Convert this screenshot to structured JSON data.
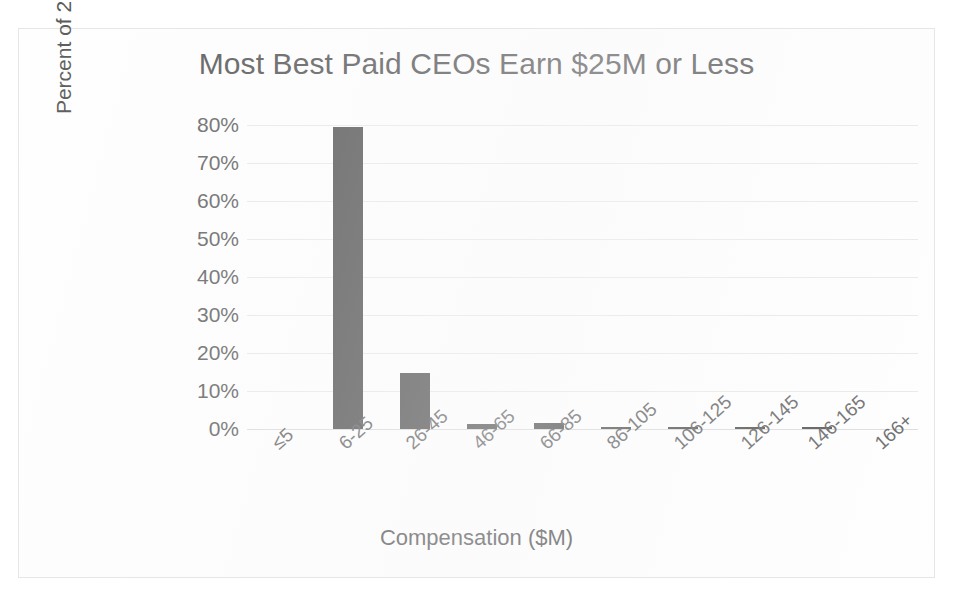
{
  "chart_data": {
    "type": "bar",
    "title": "Most Best Paid CEOs Earn $25M or Less",
    "xlabel": "Compensation ($M)",
    "ylabel": "Percent of 200 Best Paid CEOs",
    "categories": [
      "≤5",
      "6-25",
      "26-45",
      "46-65",
      "66-85",
      "86-105",
      "106-125",
      "126-145",
      "146-165",
      "166+"
    ],
    "values": [
      0,
      79.5,
      14.8,
      1.3,
      1.5,
      0.5,
      0.5,
      0.5,
      0.5,
      0
    ],
    "value_labels": [
      "0%",
      "79.5%",
      "14.8%",
      "1.3%",
      "1.5%",
      "0.5%",
      "0.5%",
      "0.5%",
      "0.5%",
      "0%"
    ],
    "ylim": [
      0,
      80
    ],
    "ytick_values": [
      0,
      10,
      20,
      30,
      40,
      50,
      60,
      70,
      80
    ],
    "ytick_labels": [
      "0%",
      "10%",
      "20%",
      "30%",
      "40%",
      "50%",
      "60%",
      "70%",
      "80%"
    ],
    "grid": true,
    "grid_axis": "y",
    "legend": false,
    "legend_position": "none",
    "bar_color": "#595959",
    "gridline_color": "#e9e9e9",
    "text_color": "#5a5a5a",
    "background_color": "#ffffff",
    "xtick_label_rotation": -42
  }
}
